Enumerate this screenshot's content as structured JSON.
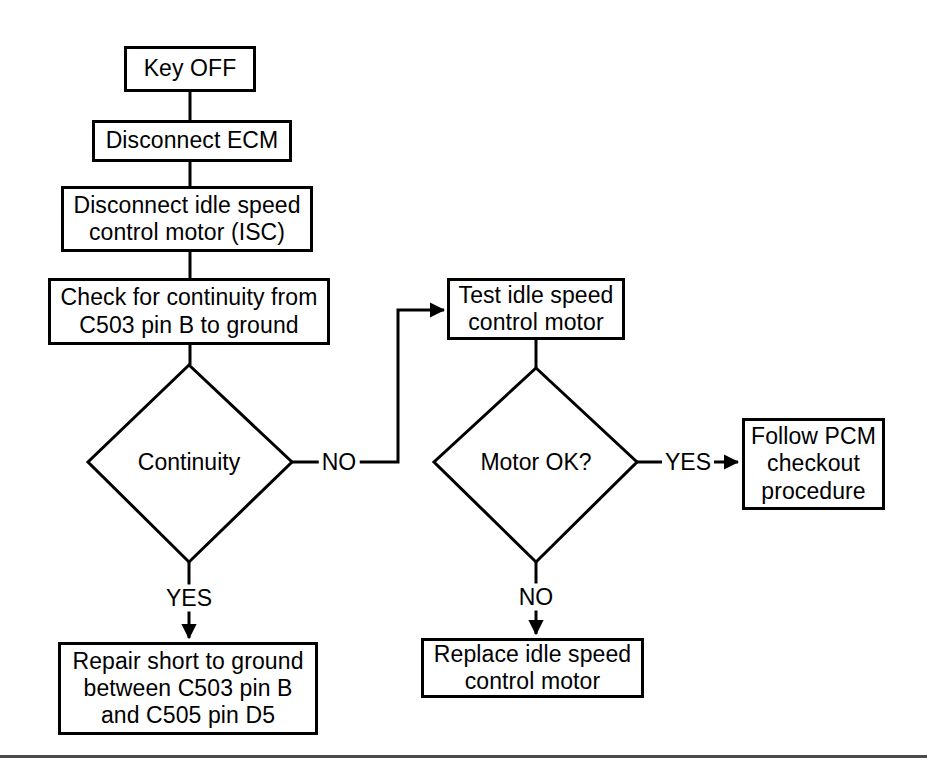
{
  "diagram": {
    "background_color": "#ffffff",
    "line_color": "#000000",
    "text_color": "#000000",
    "footer_rule_color": "#4a4a4a"
  },
  "nodes": {
    "key_off": {
      "text": "Key OFF",
      "shape": "process"
    },
    "disconnect_ecm": {
      "text": "Disconnect ECM",
      "shape": "process"
    },
    "disconnect_isc": {
      "text": "Disconnect idle speed\ncontrol motor (ISC)",
      "shape": "process"
    },
    "check_continuity": {
      "text": "Check for continuity from\nC503 pin B to ground",
      "shape": "process"
    },
    "test_isc": {
      "text": "Test idle speed\ncontrol motor",
      "shape": "process"
    },
    "follow_pcm": {
      "text": "Follow PCM\ncheckout\nprocedure",
      "shape": "process"
    },
    "repair_short": {
      "text": "Repair short to ground\nbetween C503 pin B\nand C505 pin D5",
      "shape": "process"
    },
    "replace_isc": {
      "text": "Replace idle speed\ncontrol motor",
      "shape": "process"
    },
    "continuity_decision": {
      "text": "Continuity",
      "shape": "decision"
    },
    "motor_ok_decision": {
      "text": "Motor OK?",
      "shape": "decision"
    }
  },
  "edge_labels": {
    "continuity_no": "NO",
    "continuity_yes": "YES",
    "motor_ok_yes": "YES",
    "motor_ok_no": "NO"
  }
}
